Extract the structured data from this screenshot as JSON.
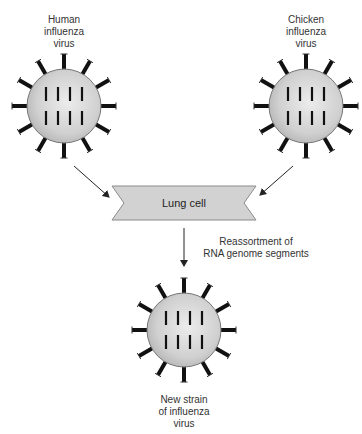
{
  "diagram": {
    "viruses": [
      {
        "id": "human",
        "label_lines": [
          "Human",
          "influenza",
          "virus"
        ],
        "cx": 64,
        "cy": 106
      },
      {
        "id": "chicken",
        "label_lines": [
          "Chicken",
          "influenza",
          "virus"
        ],
        "cx": 306,
        "cy": 106
      },
      {
        "id": "new-strain",
        "label_lines": [
          "New strain",
          "of influenza",
          "virus"
        ],
        "cx": 184,
        "cy": 330
      }
    ],
    "lung_cell": {
      "label": "Lung cell"
    },
    "process": {
      "label_lines": [
        "Reassortment of",
        "RNA genome segments"
      ]
    },
    "colors": {
      "virus_body": "#d4d4d4",
      "virus_outline": "#777777",
      "spike": "#111111",
      "banner": "#d2d2d2",
      "banner_outline": "#8a8a8a",
      "arrow": "#222222"
    }
  }
}
